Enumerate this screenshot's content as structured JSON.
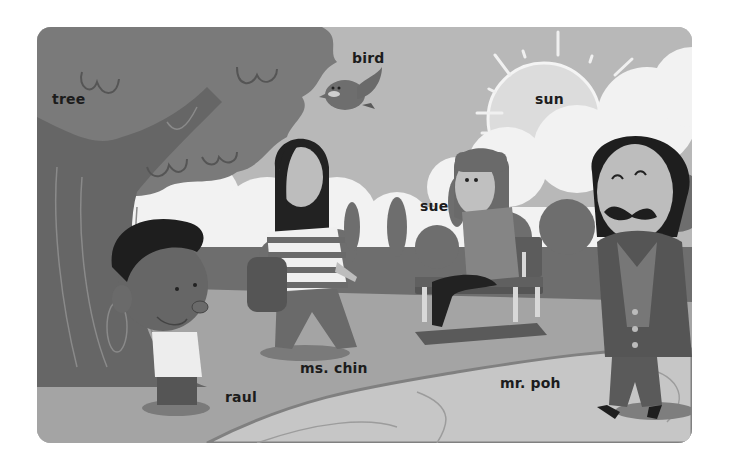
{
  "scene": {
    "description": "Grayscale cartoon park scene with labeled characters and objects",
    "palette": {
      "sky": "#b8b8b8",
      "clouds": "#f2f2f2",
      "tree_canopy": "#7a7a7a",
      "tree_trunk": "#6a6a6a",
      "bushes": "#6e6e6e",
      "grass": "#a2a2a2",
      "path": "#c4c4c4",
      "label_text": "#1c1c1c"
    }
  },
  "labels": {
    "tree": "tree",
    "bird": "bird",
    "sun": "sun",
    "sue": "sue",
    "ms_chin": "ms. chin",
    "raul": "raul",
    "mr_poh": "mr. poh"
  }
}
